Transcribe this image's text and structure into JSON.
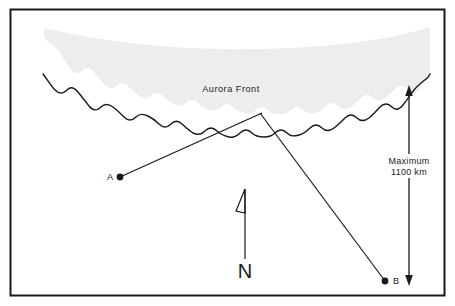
{
  "figure": {
    "title_text": "Aurora Front",
    "labels": {
      "point_a": "A",
      "point_b": "B",
      "north": "N",
      "scale_line1": "Maximum",
      "scale_line2": "1100 km"
    },
    "colors": {
      "frame_stroke": "#1a1a1a",
      "line_stroke": "#1a1a1a",
      "aurora_fill": "#ededed",
      "front_stroke": "#1a1a1a",
      "text": "#1a1a1a",
      "background": "#ffffff"
    },
    "geometry": {
      "frame": {
        "x": 10,
        "y": 9,
        "width": 435,
        "height": 287
      },
      "point_a": {
        "x": 120,
        "y": 177
      },
      "point_b": {
        "x": 385,
        "y": 281
      },
      "crossing": {
        "x": 261,
        "y": 114
      },
      "north_arrow": {
        "x": 245,
        "y_top": 188,
        "y_bottom": 258
      },
      "scale_arrow": {
        "x": 409,
        "y_top": 86,
        "y_bottom": 285
      }
    }
  }
}
